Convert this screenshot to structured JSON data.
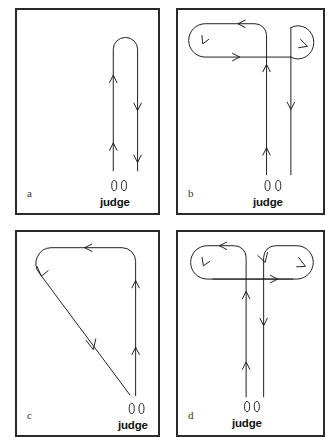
{
  "figure": {
    "type": "diagram",
    "background_color": "#ffffff",
    "line_color": "#1c1c1c",
    "border_color": "#2a2a2a"
  },
  "panels": [
    {
      "id": "a",
      "letter": "a",
      "judge_label": "judge",
      "footprints_icon": "footprints-icon",
      "pattern": "narrow-hairpin",
      "pattern_description": "Two parallel straight lines running away from the judge joined by a rounded U-turn at the far end; left line travels away (up) with two up-arrows, right line returns (down) with two down-arrows"
    },
    {
      "id": "b",
      "letter": "b",
      "judge_label": "judge",
      "footprints_icon": "footprints-icon",
      "pattern": "large-left-loop-small-right-loop",
      "pattern_description": "Left line runs away from judge then makes a large counterclockwise stadium loop to the left; right line makes a small clockwise loop at top right and returns toward the judge"
    },
    {
      "id": "c",
      "letter": "c",
      "judge_label": "judge",
      "footprints_icon": "footprints-icon",
      "pattern": "diagonal-return",
      "pattern_description": "Line runs up the right side, turns left across the top, curves down at the top-left corner and returns on a long diagonal back to the judge"
    },
    {
      "id": "d",
      "letter": "d",
      "judge_label": "judge",
      "footprints_icon": "footprints-icon",
      "pattern": "double-loop-symmetric",
      "pattern_description": "Two parallel lines from the judge; the left line loops counterclockwise to the left at the top, the right line loops to the right at the top, the two loops crossing near the centre"
    }
  ]
}
